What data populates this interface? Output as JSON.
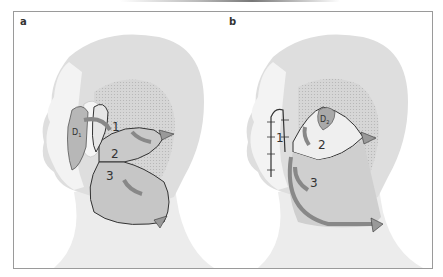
{
  "figure": {
    "panels": [
      {
        "label": "a",
        "flaps": [
          "1",
          "2",
          "3"
        ],
        "defect_label": "D",
        "defect_subscript": "1"
      },
      {
        "label": "b",
        "flaps": [
          "1",
          "2",
          "3"
        ],
        "defect_label": "D",
        "defect_subscript": "2"
      }
    ],
    "colors": {
      "head": "#dcdcdc",
      "skin_light": "#ededed",
      "flap": "#c4c4c4",
      "arrow": "#8c8c8c",
      "outline": "#3a3a3a",
      "dotted_area": "#d0d0d0",
      "border": "#9a9a9a"
    }
  }
}
